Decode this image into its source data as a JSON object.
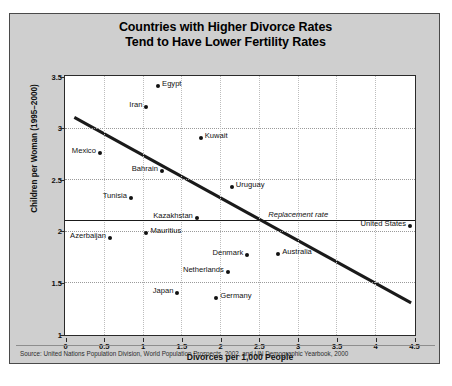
{
  "title": {
    "line1": "Countries with Higher Divorce Rates",
    "line2": "Tend to Have Lower Fertility Rates"
  },
  "source": "Source: United Nations Population Division, World Population Prospects, 2002, and UN Demographic Yearbook, 2000",
  "chart_data": {
    "type": "scatter",
    "title": "Countries with Higher Divorce Rates Tend to Have Lower Fertility Rates",
    "xlabel": "Divorces per 1,000 People",
    "ylabel": "Children per Woman (1995–2000)",
    "xlim": [
      0,
      4.5
    ],
    "ylim": [
      1,
      3.5
    ],
    "xticks": [
      "0",
      "0.5",
      "1",
      "1.5",
      "2",
      "2.5",
      "3",
      "3.5",
      "4",
      "4.5"
    ],
    "xtick_values": [
      0,
      0.5,
      1,
      1.5,
      2,
      2.5,
      3,
      3.5,
      4,
      4.5
    ],
    "yticks": [
      "1",
      "1.5",
      "2",
      "2.5",
      "3",
      "3.5"
    ],
    "ytick_values": [
      1,
      1.5,
      2,
      2.5,
      3,
      3.5
    ],
    "grid": true,
    "legend": "none",
    "points": [
      {
        "name": "Egypt",
        "x": 1.2,
        "y": 3.4,
        "label_pos": "right"
      },
      {
        "name": "Iran",
        "x": 1.05,
        "y": 3.2,
        "label_pos": "left"
      },
      {
        "name": "Kuwait",
        "x": 1.75,
        "y": 2.9,
        "label_pos": "right"
      },
      {
        "name": "Mexico",
        "x": 0.45,
        "y": 2.75,
        "label_pos": "left"
      },
      {
        "name": "Bahrain",
        "x": 1.25,
        "y": 2.58,
        "label_pos": "left"
      },
      {
        "name": "Uruguay",
        "x": 2.15,
        "y": 2.42,
        "label_pos": "right"
      },
      {
        "name": "Tunisia",
        "x": 0.85,
        "y": 2.32,
        "label_pos": "left"
      },
      {
        "name": "Kazakhstan",
        "x": 1.7,
        "y": 2.12,
        "label_pos": "left"
      },
      {
        "name": "United States",
        "x": 4.45,
        "y": 2.05,
        "label_pos": "left"
      },
      {
        "name": "Mauritius",
        "x": 1.05,
        "y": 1.98,
        "label_pos": "right"
      },
      {
        "name": "Azerbaijan",
        "x": 0.58,
        "y": 1.93,
        "label_pos": "left"
      },
      {
        "name": "Denmark",
        "x": 2.35,
        "y": 1.77,
        "label_pos": "left"
      },
      {
        "name": "Australia",
        "x": 2.75,
        "y": 1.78,
        "label_pos": "right"
      },
      {
        "name": "Netherlands",
        "x": 2.1,
        "y": 1.6,
        "label_pos": "left"
      },
      {
        "name": "Japan",
        "x": 1.45,
        "y": 1.4,
        "label_pos": "left"
      },
      {
        "name": "Germany",
        "x": 1.95,
        "y": 1.35,
        "label_pos": "right"
      }
    ],
    "annotations": [
      {
        "name": "replacement-rate",
        "text": "Replacement rate",
        "y": 2.1
      }
    ],
    "trendline": {
      "x0": 0.12,
      "y0": 3.1,
      "x1": 4.45,
      "y1": 1.31
    }
  },
  "colors": {
    "figure_background": "#cfcfcf",
    "plot_background": "#ffffff",
    "marker": "#111111",
    "trendline": "#1a1a1a",
    "gridline": "#9a9a9a"
  }
}
